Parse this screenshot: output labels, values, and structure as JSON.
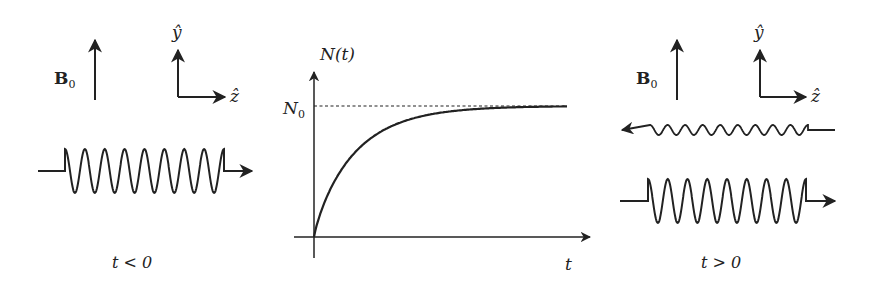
{
  "figure": {
    "left_panel": {
      "field_label": "B",
      "field_subscript": "0",
      "axis_y_label": "ŷ",
      "axis_z_label": "ẑ",
      "time_caption": "t < 0",
      "wave": {
        "direction": "right",
        "cycles": 8,
        "amplitude": "large"
      }
    },
    "center_panel": {
      "y_axis_label": "N(t)",
      "saturation_label": "N",
      "saturation_subscript": "0",
      "x_axis_label": "t",
      "curve": "N(t) = N0 (1 - exp(-t/τ))"
    },
    "right_panel": {
      "field_label": "B",
      "field_subscript": "0",
      "axis_y_label": "ŷ",
      "axis_z_label": "ẑ",
      "time_caption": "t > 0",
      "waves": [
        {
          "direction": "left",
          "cycles": 9,
          "amplitude": "small"
        },
        {
          "direction": "right",
          "cycles": 8,
          "amplitude": "large"
        }
      ]
    },
    "colors": {
      "ink": "#222222",
      "background": "#ffffff"
    }
  },
  "chart_data": {
    "type": "line",
    "title": "",
    "xlabel": "t",
    "ylabel": "N(t)",
    "series": [
      {
        "name": "N(t)",
        "x": [
          0,
          0.5,
          1,
          2,
          3,
          4,
          5,
          6
        ],
        "values": [
          0,
          0.39,
          0.63,
          0.86,
          0.95,
          0.98,
          0.99,
          1.0
        ]
      }
    ],
    "annotations": [
      {
        "type": "hline",
        "y": 1.0,
        "label": "N0",
        "style": "dashed"
      }
    ],
    "grid": false
  }
}
